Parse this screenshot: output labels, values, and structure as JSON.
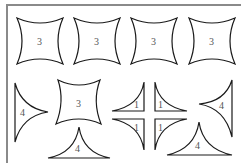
{
  "figure": {
    "frame_color": "#8a8a8a",
    "stroke_color": "#1a1a1a",
    "label_color": "#555555",
    "row1": [
      {
        "shape": "concave-square",
        "label": "3"
      },
      {
        "shape": "concave-square",
        "label": "3"
      },
      {
        "shape": "concave-square",
        "label": "3"
      },
      {
        "shape": "concave-square",
        "label": "3"
      }
    ],
    "row2": {
      "left_triangle": {
        "shape": "concave-triangle-pointing-right",
        "label": "4"
      },
      "square": {
        "shape": "concave-square",
        "label": "3"
      },
      "bottom_triangle_left": {
        "shape": "concave-triangle-pointing-up",
        "label": "4"
      },
      "quarters": [
        {
          "position": "top-left",
          "label": "1"
        },
        {
          "position": "top-right",
          "label": "1"
        },
        {
          "position": "bottom-left",
          "label": "1"
        },
        {
          "position": "bottom-right",
          "label": "1"
        }
      ],
      "right_triangle": {
        "shape": "concave-triangle-pointing-left",
        "label": "4"
      },
      "bottom_triangle_right": {
        "shape": "concave-triangle-pointing-up",
        "label": "4"
      }
    }
  }
}
